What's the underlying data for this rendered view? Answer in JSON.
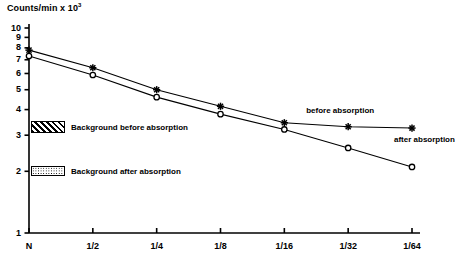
{
  "chart_data": {
    "type": "line",
    "title": "Counts/min x 10",
    "title_exponent": "3",
    "xlabel": "",
    "ylabel": "",
    "yscale": "log",
    "ylim": [
      1,
      10
    ],
    "ytick_labels": [
      "10",
      "9",
      "8",
      "7",
      "6",
      "5",
      "4",
      "3",
      "2",
      "1"
    ],
    "ytick_values": [
      10,
      9,
      8,
      7,
      6,
      5,
      4,
      3,
      2,
      1
    ],
    "categories": [
      "N",
      "1/2",
      "1/4",
      "1/8",
      "1/16",
      "1/32",
      "1/64"
    ],
    "grid": false,
    "legend_position": "inline-annotations",
    "series": [
      {
        "name": "before absorption",
        "marker": "star",
        "values": [
          7.8,
          6.4,
          5.0,
          4.15,
          3.45,
          3.3,
          3.25
        ]
      },
      {
        "name": "after absorption",
        "marker": "open-circle",
        "values": [
          7.3,
          5.9,
          4.6,
          3.8,
          3.2,
          2.6,
          2.1
        ]
      }
    ],
    "annotations": [
      {
        "text": "before absorption",
        "x_category": "1/32",
        "y": 3.95
      },
      {
        "text": "after absorption",
        "x_category": "1/64",
        "y": 2.85
      }
    ],
    "bands": [
      {
        "label": "Background before absorption",
        "fill": "diagonal-hatch",
        "y": 3.3,
        "y_low": 3.15,
        "y_high": 3.45
      },
      {
        "label": "Background after absorption",
        "fill": "dotted",
        "y": 2.0,
        "y_low": 1.93,
        "y_high": 2.08
      }
    ]
  },
  "colors": {
    "axis": "#000000",
    "series_before": "#000000",
    "series_after": "#000000",
    "background": "#ffffff"
  }
}
